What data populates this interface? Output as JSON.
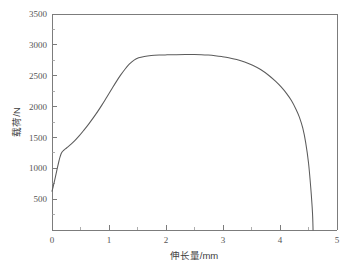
{
  "chart_data": {
    "type": "line",
    "title": "",
    "xlabel": "伸长量/mm",
    "ylabel": "载荷/N",
    "xlim": [
      0,
      5
    ],
    "ylim": [
      0,
      3500
    ],
    "xticks": [
      "0",
      "1",
      "2",
      "3",
      "4",
      "5"
    ],
    "xtick_values": [
      0,
      1,
      2,
      3,
      4,
      5
    ],
    "x_minor_step": 0.5,
    "yticks": [
      "0",
      "500",
      "1000",
      "1500",
      "2000",
      "2500",
      "3000",
      "3500"
    ],
    "ytick_values": [
      0,
      500,
      1000,
      1500,
      2000,
      2500,
      3000,
      3500
    ],
    "y_minor_step": 250,
    "grid": false,
    "legend": null,
    "line_color": "#5b5b5b",
    "axis_color": "#7c7c7c",
    "background": "#ffffff",
    "series": [
      {
        "name": "载荷-伸长量曲线",
        "x": [
          0.0,
          0.02,
          0.04,
          0.06,
          0.08,
          0.1,
          0.12,
          0.14,
          0.16,
          0.18,
          0.2,
          0.24,
          0.28,
          0.34,
          0.4,
          0.48,
          0.56,
          0.64,
          0.72,
          0.8,
          0.88,
          0.96,
          1.04,
          1.12,
          1.2,
          1.28,
          1.36,
          1.44,
          1.52,
          1.62,
          1.74,
          1.88,
          2.02,
          2.18,
          2.34,
          2.5,
          2.62,
          2.74,
          2.86,
          2.98,
          3.1,
          3.24,
          3.38,
          3.52,
          3.66,
          3.8,
          3.92,
          4.02,
          4.12,
          4.2,
          4.28,
          4.34,
          4.4,
          4.45,
          4.5,
          4.54,
          4.57,
          4.58
        ],
        "y": [
          630,
          700,
          780,
          860,
          945,
          1030,
          1110,
          1180,
          1235,
          1268,
          1288,
          1318,
          1348,
          1395,
          1448,
          1528,
          1618,
          1712,
          1812,
          1918,
          2032,
          2152,
          2272,
          2392,
          2505,
          2605,
          2690,
          2752,
          2790,
          2812,
          2826,
          2834,
          2838,
          2841,
          2843,
          2843,
          2840,
          2834,
          2824,
          2810,
          2792,
          2762,
          2722,
          2670,
          2600,
          2508,
          2412,
          2318,
          2206,
          2098,
          1958,
          1830,
          1650,
          1420,
          1090,
          680,
          280,
          0
        ]
      }
    ],
    "annotations": {
      "yield_point_n": 1288,
      "peak_load_n": 2843,
      "peak_elongation_mm": 2.4,
      "fracture_elongation_mm": 4.58,
      "initial_load_n": 630
    }
  },
  "layout": {
    "plot_left_px": 52,
    "plot_right_px": 337,
    "plot_top_px": 14,
    "plot_bottom_px": 230,
    "width_px": 348,
    "height_px": 272
  }
}
